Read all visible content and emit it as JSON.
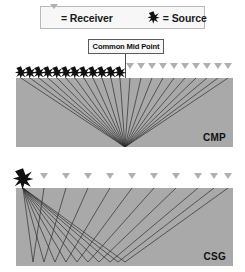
{
  "figure": {
    "background_color": "#ffffff",
    "width": 245,
    "height": 272
  },
  "legend": {
    "box": {
      "x": 40,
      "y": 6,
      "width": 165,
      "height": 23,
      "fill": "#f7f7f7",
      "border": "#b9b9b9"
    },
    "entries": [
      {
        "icon": "receiver-triangle-icon",
        "equals": "=",
        "label": "= Receiver",
        "color": "#b0b0b0"
      },
      {
        "icon": "source-star-icon",
        "equals": "=",
        "label": "= Source",
        "color": "#111111"
      }
    ]
  },
  "callout": {
    "label": "Common Mid Point",
    "box": {
      "x": 88,
      "y": 39,
      "width": 76,
      "height": 15
    },
    "leader_line": {
      "x": 125,
      "y_start": 54,
      "y_end": 147,
      "color": "#4a4a4a"
    }
  },
  "panels": [
    {
      "id": "panel-cmp",
      "tag": "CMP",
      "tag_full_name": "Common Mid Point gather",
      "geometry": {
        "x": 16,
        "y": 78,
        "width": 217,
        "height": 69
      },
      "fill_color": "#a9a9a9",
      "ray_color": "#2e2e2e",
      "description": "Twelve source-receiver pairs symmetric about one common mid point; every raypath reflects from the same subsurface point.",
      "reflection_point": {
        "x": 109,
        "y": 69
      },
      "sources": [
        {
          "index": 1,
          "x": 5
        },
        {
          "index": 2,
          "x": 14
        },
        {
          "index": 3,
          "x": 23
        },
        {
          "index": 4,
          "x": 32
        },
        {
          "index": 5,
          "x": 41
        },
        {
          "index": 6,
          "x": 50
        },
        {
          "index": 7,
          "x": 59
        },
        {
          "index": 8,
          "x": 68
        },
        {
          "index": 9,
          "x": 77
        },
        {
          "index": 10,
          "x": 86
        },
        {
          "index": 11,
          "x": 95
        },
        {
          "index": 12,
          "x": 104
        }
      ],
      "receivers": [
        {
          "index": 1,
          "x": 114
        },
        {
          "index": 2,
          "x": 125
        },
        {
          "index": 3,
          "x": 136
        },
        {
          "index": 4,
          "x": 147
        },
        {
          "index": 5,
          "x": 158
        },
        {
          "index": 6,
          "x": 169
        },
        {
          "index": 7,
          "x": 180
        },
        {
          "index": 8,
          "x": 191
        },
        {
          "index": 9,
          "x": 202
        },
        {
          "index": 10,
          "x": 212
        }
      ]
    },
    {
      "id": "panel-csg",
      "tag": "CSG",
      "tag_full_name": "Common Source Gather",
      "geometry": {
        "x": 16,
        "y": 188,
        "width": 217,
        "height": 78
      },
      "fill_color": "#a9a9a9",
      "ray_color": "#2e2e2e",
      "description": "One single source on the left shoots into the subsurface; each raypath reflects from a different depth point and returns to a different receiver along the spread.",
      "source": {
        "x": 7,
        "y": 0
      },
      "receivers": [
        {
          "index": 1,
          "x": 28
        },
        {
          "index": 2,
          "x": 50
        },
        {
          "index": 3,
          "x": 72
        },
        {
          "index": 4,
          "x": 94
        },
        {
          "index": 5,
          "x": 116
        },
        {
          "index": 6,
          "x": 138
        },
        {
          "index": 7,
          "x": 160
        },
        {
          "index": 8,
          "x": 182
        },
        {
          "index": 9,
          "x": 198
        },
        {
          "index": 10,
          "x": 212
        }
      ],
      "reflection_points": [
        {
          "index": 1,
          "x": 17,
          "y": 74
        },
        {
          "index": 2,
          "x": 28,
          "y": 74
        },
        {
          "index": 3,
          "x": 39,
          "y": 74
        },
        {
          "index": 4,
          "x": 50,
          "y": 74
        },
        {
          "index": 5,
          "x": 61,
          "y": 74
        },
        {
          "index": 6,
          "x": 72,
          "y": 74
        },
        {
          "index": 7,
          "x": 83,
          "y": 74
        },
        {
          "index": 8,
          "x": 94,
          "y": 74
        },
        {
          "index": 9,
          "x": 102,
          "y": 74
        },
        {
          "index": 10,
          "x": 109,
          "y": 74
        }
      ]
    }
  ],
  "colors": {
    "panel_gray": "#a9a9a9",
    "ray_dark": "#2e2e2e",
    "receiver_gray": "#b0b0b0",
    "source_black": "#111111",
    "legend_fill": "#f7f7f7",
    "legend_border": "#b9b9b9",
    "page_background": "#ffffff"
  }
}
